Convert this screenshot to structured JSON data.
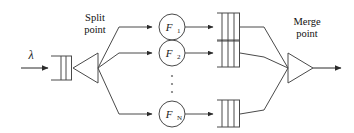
{
  "diagram": {
    "labels": {
      "split_line1": "Split",
      "split_line2": "point",
      "merge_line1": "Merge",
      "merge_line2": "point",
      "arrival_rate": "λ"
    },
    "nodes": [
      {
        "id": "f1",
        "label": "F",
        "subscript": "1",
        "full": "F1"
      },
      {
        "id": "f2",
        "label": "F",
        "subscript": "2",
        "full": "F2"
      },
      {
        "id": "fn",
        "label": "F",
        "subscript": "N",
        "full": "FN"
      }
    ],
    "ellipsis": "⋮",
    "queues": [
      {
        "id": "input-queue",
        "slots": 3
      },
      {
        "id": "branch-queue-1",
        "slots": 3
      },
      {
        "id": "branch-queue-2",
        "slots": 3
      },
      {
        "id": "branch-queue-n",
        "slots": 3
      }
    ],
    "splitter": {
      "shape": "triangle-left"
    },
    "merger": {
      "shape": "triangle-right"
    },
    "colors": {
      "stroke": "#4a4a4a",
      "arrow": "#2b2b2b",
      "text": "#1a1a1a",
      "background": "#ffffff",
      "ellipsis": "#7a7a7a"
    }
  }
}
